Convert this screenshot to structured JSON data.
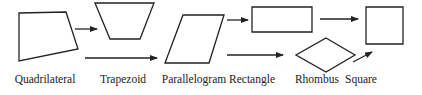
{
  "diagram": {
    "stroke_color": "#222222",
    "shapes": [
      {
        "id": "quadrilateral",
        "label": "Quadrilateral",
        "points": "19,13 66,12 78,49 19,61",
        "label_x": 45
      },
      {
        "id": "trapezoid",
        "label": "Trapezoid",
        "points": "95,3 154,3 140,39 110,39",
        "label_x": 123
      },
      {
        "id": "parallelogram",
        "label": "Parallelogram",
        "points": "183,15 224,15 209,63 165,63",
        "label_x": 194
      },
      {
        "id": "rectangle",
        "label": "Rectangle",
        "points": "252,7 312,7 312,32 252,32",
        "label_x": 252
      },
      {
        "id": "rhombus",
        "label": "Rhombus",
        "points": "326,38 355,55 326,72 296,55",
        "label_x": 317
      },
      {
        "id": "square",
        "label": "Square",
        "points": "366,7 403,7 403,44 366,44",
        "label_x": 361
      }
    ],
    "arrows": [
      {
        "from": "quadrilateral",
        "to": "trapezoid",
        "x1": 75,
        "y1": 29,
        "x2": 97,
        "y2": 29
      },
      {
        "from": "quadrilateral",
        "to": "parallelogram",
        "x1": 85,
        "y1": 58,
        "x2": 157,
        "y2": 58
      },
      {
        "from": "parallelogram",
        "to": "rectangle",
        "x1": 227,
        "y1": 20,
        "x2": 248,
        "y2": 20
      },
      {
        "from": "parallelogram",
        "to": "rhombus",
        "x1": 227,
        "y1": 55,
        "x2": 283,
        "y2": 55
      },
      {
        "from": "rectangle",
        "to": "square",
        "x1": 320,
        "y1": 19,
        "x2": 358,
        "y2": 19
      },
      {
        "from": "rhombus",
        "to": "square",
        "x1": 353,
        "y1": 62,
        "x2": 372,
        "y2": 52
      }
    ]
  }
}
